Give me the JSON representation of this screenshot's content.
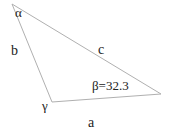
{
  "diagram": {
    "type": "triangle",
    "vertices": {
      "alpha": {
        "label": "α"
      },
      "beta": {
        "label": "β=32.3"
      },
      "gamma": {
        "label": "γ"
      }
    },
    "sides": {
      "a": {
        "label": "a"
      },
      "b": {
        "label": "b"
      },
      "c": {
        "label": "c"
      }
    },
    "line_color": "#b0b0b0"
  }
}
